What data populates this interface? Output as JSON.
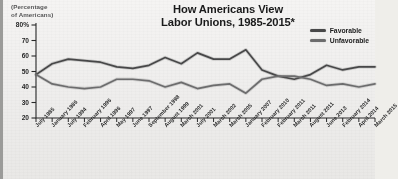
{
  "chart_data": {
    "type": "line",
    "title": "How Americans View Labor Unions, 1985-2015*",
    "title_line1": "How Americans View",
    "title_line2": "Labor Unions, 1985-2015*",
    "ylabel": "(Percentage of Americans)",
    "ylabel_line1": "(Percentage",
    "ylabel_line2": "of Americans)",
    "xlabel": "",
    "ylim": [
      20,
      80
    ],
    "yticks": [
      "80%",
      "70",
      "60",
      "50",
      "40",
      "30",
      "20"
    ],
    "ytick_values": [
      80,
      70,
      60,
      50,
      40,
      30,
      20
    ],
    "grid": false,
    "legend_position": "top-right",
    "categories": [
      "July 1985",
      "January 1986",
      "July 1994",
      "February 1996",
      "April 1996",
      "May 1997",
      "June 1997",
      "September 1998",
      "August 1999",
      "March 2001",
      "July 2001",
      "March 2002",
      "March 2005",
      "January 2007",
      "February 2010",
      "February 2011",
      "March 2011",
      "August 2011",
      "June 2013",
      "February 2014",
      "April 2014",
      "March 2015"
    ],
    "series": [
      {
        "name": "Favorable",
        "color": "#4a4a4c",
        "values": [
          48,
          55,
          58,
          57,
          56,
          53,
          52,
          54,
          59,
          55,
          62,
          58,
          58,
          64,
          51,
          47,
          45,
          48,
          54,
          51,
          53,
          53
        ]
      },
      {
        "name": "Unfavorable",
        "color": "#6d6d70",
        "values": [
          48,
          42,
          40,
          39,
          40,
          45,
          45,
          44,
          40,
          43,
          39,
          41,
          42,
          36,
          45,
          47,
          47,
          45,
          41,
          42,
          40,
          42
        ]
      }
    ],
    "legend": [
      "Favorable",
      "Unfavorable"
    ],
    "footnote": "*"
  },
  "colors": {
    "background": "#efeeea",
    "axis": "#2b2b2d",
    "favorable": "#4a4a4c",
    "unfavorable": "#6d6d70",
    "text": "#1d1d1f"
  }
}
